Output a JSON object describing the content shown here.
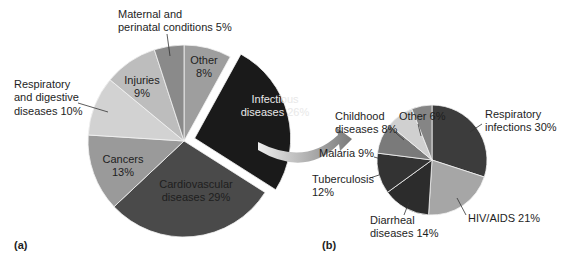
{
  "panels": {
    "a_label": "(a)",
    "b_label": "(b)"
  },
  "chart_data": [
    {
      "type": "pie",
      "id": "a",
      "title": "",
      "center": [
        184,
        141
      ],
      "radius": 96,
      "start_angle_deg": 0,
      "exploded": "Infectious diseases",
      "slices": [
        {
          "label": "Infectious diseases",
          "value": 26,
          "color": "#1a1a1a",
          "text_color": "#e8e8e8",
          "label_lines": [
            "Infectious",
            "diseases 26%"
          ],
          "label_pos": [
            275,
            103
          ],
          "exploded": true
        },
        {
          "label": "Cardiovascular diseases",
          "value": 29,
          "color": "#4a4a4a",
          "text_color": "#1e1e1e",
          "label_lines": [
            "Cardiovascular",
            "diseases 29%"
          ],
          "label_pos": [
            196,
            188
          ]
        },
        {
          "label": "Cancers",
          "value": 13,
          "color": "#9a9a9a",
          "text_color": "#1e1e1e",
          "label_lines": [
            "Cancers",
            "13%"
          ],
          "label_pos": [
            123,
            163
          ]
        },
        {
          "label": "Respiratory and digestive diseases",
          "value": 10,
          "color": "#d2d2d2",
          "text_color": "#1e1e1e",
          "label_lines": [
            "Respiratory",
            "and digestive",
            "diseases 10%"
          ],
          "label_pos": [
            14,
            88
          ],
          "outside": true,
          "leader": [
            [
              78,
              103
            ],
            [
              108,
              112
            ]
          ]
        },
        {
          "label": "Injuries",
          "value": 9,
          "color": "#bdbdbd",
          "text_color": "#1e1e1e",
          "label_lines": [
            "Injuries",
            "9%"
          ],
          "label_pos": [
            142,
            84
          ]
        },
        {
          "label": "Maternal and perinatal conditions",
          "value": 5,
          "color": "#8a8a8a",
          "text_color": "#1e1e1e",
          "label_lines": [
            "Maternal and",
            "perinatal conditions 5%"
          ],
          "label_pos": [
            118,
            18
          ],
          "outside": true,
          "leader": [
            [
              167,
              34
            ],
            [
              170,
              56
            ]
          ]
        },
        {
          "label": "Other",
          "value": 8,
          "color": "#9e9e9e",
          "text_color": "#1e1e1e",
          "label_lines": [
            "Other",
            "8%"
          ],
          "label_pos": [
            204,
            64
          ]
        }
      ]
    },
    {
      "type": "pie",
      "id": "b",
      "title": "",
      "center": [
        432,
        160
      ],
      "radius": 55,
      "start_angle_deg": 0,
      "slices": [
        {
          "label": "Respiratory infections",
          "value": 30,
          "color": "#3c3c3c",
          "label_lines": [
            "Respiratory",
            "infections 30%"
          ],
          "label_pos": [
            485,
            118
          ],
          "outside": true,
          "leader": [
            [
              482,
              124
            ],
            [
              470,
              132
            ]
          ]
        },
        {
          "label": "HIV/AIDS",
          "value": 21,
          "color": "#a6a6a6",
          "label_lines": [
            "HIV/AIDS 21%"
          ],
          "label_pos": [
            468,
            222
          ],
          "outside": true,
          "leader": [
            [
              466,
              215
            ],
            [
              457,
              198
            ]
          ]
        },
        {
          "label": "Diarrheal diseases",
          "value": 14,
          "color": "#2c2c2c",
          "label_lines": [
            "Diarrheal",
            "diseases 14%"
          ],
          "label_pos": [
            370,
            224
          ],
          "outside": true,
          "leader": [
            [
              404,
              215
            ],
            [
              409,
              202
            ]
          ]
        },
        {
          "label": "Tuberculosis",
          "value": 12,
          "color": "#333333",
          "label_lines": [
            "Tuberculosis",
            "12%"
          ],
          "label_pos": [
            312,
            183
          ],
          "outside": true,
          "leader": [
            [
              370,
              178
            ],
            [
              388,
              172
            ]
          ]
        },
        {
          "label": "Malaria",
          "value": 9,
          "color": "#7a7a7a",
          "label_lines": [
            "Malaria 9%"
          ],
          "label_pos": [
            319,
            157
          ],
          "outside": true,
          "leader": [
            [
              374,
              157
            ],
            [
              392,
              162
            ]
          ]
        },
        {
          "label": "Childhood diseases",
          "value": 8,
          "color": "#d0d0d0",
          "label_lines": [
            "Childhood",
            "diseases 8%"
          ],
          "label_pos": [
            335,
            120
          ],
          "outside": true,
          "leader": [
            [
              396,
              133
            ],
            [
              404,
              140
            ]
          ]
        },
        {
          "label": "Other",
          "value": 6,
          "color": "#858585",
          "label_lines": [
            "Other 6%"
          ],
          "label_pos": [
            399,
            120
          ],
          "outside": true,
          "leader": [
            [
              418,
              124
            ],
            [
              421,
              136
            ]
          ]
        }
      ]
    }
  ],
  "arrow": {
    "from": "Infectious diseases (a)",
    "to": "pie (b)",
    "start": [
      258,
      144
    ],
    "end": [
      352,
      139
    ],
    "color_start": "#e6e6e6",
    "color_end": "#7a7a7a"
  }
}
